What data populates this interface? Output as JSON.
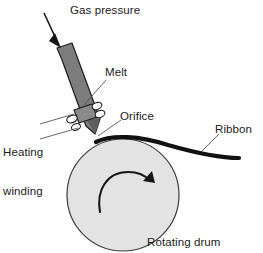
{
  "figure": {
    "width": 263,
    "height": 253,
    "background_color": "#ffffff"
  },
  "labels": {
    "gas_pressure": "Gas pressure",
    "melt": "Melt",
    "orifice": "Orifice",
    "heating_winding_line1": "Heating",
    "heating_winding_line2": "winding",
    "ribbon": "Ribbon",
    "rotating_drum": "Rotating drum"
  },
  "colors": {
    "outline": "#1a1a1a",
    "nozzle_fill": "#7d7d7d",
    "drum_fill": "#e3e3e3",
    "drum_stroke": "#3c3c3c",
    "ribbon": "#111111",
    "leader_line": "#555555",
    "text": "#1a1a1a"
  },
  "parts": {
    "nozzle": {
      "name": "crucible-nozzle",
      "description": "tapered gray tube tilted toward lower right ending in a tip at the drum surface"
    },
    "heating_winding": {
      "name": "heating-winding",
      "description": "coil loops wrapped around the lower nozzle",
      "loop_count": 4
    },
    "drum": {
      "name": "rotating-drum",
      "center_x": 123,
      "center_y": 195,
      "radius": 56,
      "rotation_direction": "clockwise"
    },
    "ribbon": {
      "name": "ribbon",
      "description": "thick dark ribbon leaving the drum toward the right edge"
    },
    "gas_arrow": {
      "name": "gas-pressure-arrow",
      "direction": "down-right"
    },
    "rotation_arrow": {
      "name": "rotation-arrow",
      "direction": "clockwise"
    }
  }
}
